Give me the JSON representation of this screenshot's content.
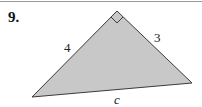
{
  "problem": {
    "number": "9."
  },
  "triangle": {
    "fill": "#c8c8c8",
    "stroke": "#3a3a3a",
    "vertices": {
      "right_angle": [
        117,
        11
      ],
      "left": [
        32,
        97
      ],
      "right": [
        192,
        83
      ]
    },
    "labels": {
      "left_leg": "4",
      "right_leg": "3",
      "hypotenuse": "c"
    },
    "right_angle_marker": true
  }
}
